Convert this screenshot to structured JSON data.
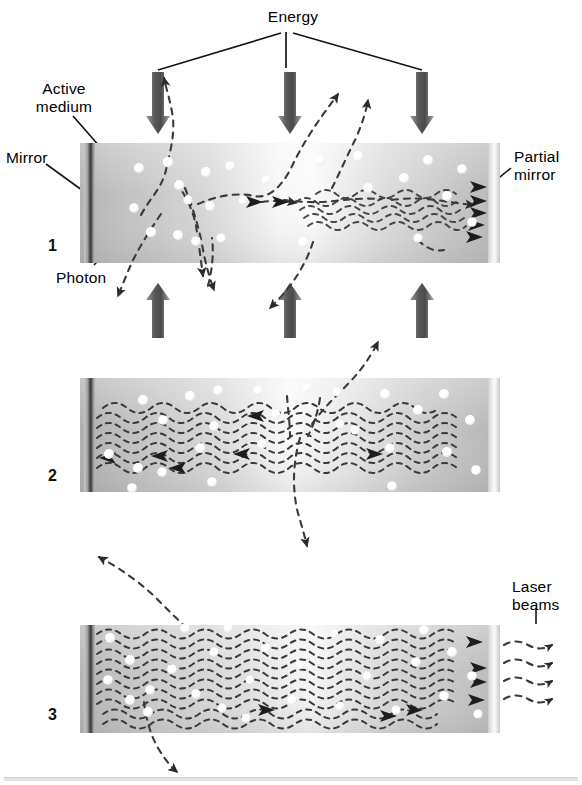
{
  "figure": {
    "title_hidden": "",
    "type": "laser-operation-diagram",
    "panel_count": 3
  },
  "labels": {
    "energy": "Energy",
    "active_medium": "Active\nmedium",
    "mirror": "Mirror",
    "partial_mirror": "Partial\nmirror",
    "photon": "Photon",
    "laser_beams": "Laser\nbeams"
  },
  "steps": [
    {
      "number": "1"
    },
    {
      "number": "2"
    },
    {
      "number": "3"
    }
  ],
  "colors": {
    "medium_dark": "#b4b4b4",
    "medium_light": "#f2f2f2",
    "mirror_dark": "#4a4a4a",
    "partial_mirror": "#d8d8d8",
    "arrow_gray": "#6d6d6d",
    "trail": "#3a3a3a",
    "photon_fill": "#ffffff",
    "rule": "#e3e3e3",
    "text": "#000000"
  },
  "panels": {
    "p1": {
      "x": 80,
      "y": 143,
      "w": 420,
      "h": 120,
      "energy_arrows_down": [
        {
          "x": 158,
          "label": "energy-arrow-down-1"
        },
        {
          "x": 290,
          "label": "energy-arrow-down-2"
        },
        {
          "x": 422,
          "label": "energy-arrow-down-3"
        }
      ],
      "energy_arrows_up": [
        {
          "x": 158,
          "label": "energy-arrow-up-1"
        },
        {
          "x": 290,
          "label": "energy-arrow-up-2"
        },
        {
          "x": 422,
          "label": "energy-arrow-up-3"
        }
      ],
      "photon_count": 22,
      "description": "Spontaneous emission: photons scatter in random directions."
    },
    "p2": {
      "x": 80,
      "y": 378,
      "w": 420,
      "h": 114,
      "photon_count": 24,
      "description": "Stimulated emission builds coherent wave trains along the axis."
    },
    "p3": {
      "x": 80,
      "y": 625,
      "w": 420,
      "h": 108,
      "photon_count": 26,
      "beam_count": 4,
      "description": "Amplified light exits through the partial mirror as laser beams."
    }
  }
}
